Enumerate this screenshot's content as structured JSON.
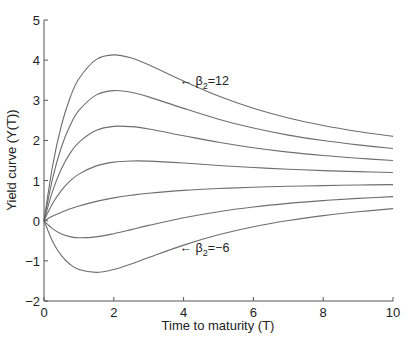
{
  "chart_data": {
    "type": "line",
    "title": "",
    "xlabel": "Time to maturity (T)",
    "ylabel": "Yield curve (Y(T))",
    "xlim": [
      0,
      10
    ],
    "ylim": [
      -2,
      5
    ],
    "xticks": [
      0,
      2,
      4,
      6,
      8,
      10
    ],
    "yticks": [
      -2,
      -1,
      0,
      1,
      2,
      3,
      4,
      5
    ],
    "grid": false,
    "legend": "none",
    "line_color": "#6e6e6e",
    "x": [
      0,
      0.25,
      0.5,
      0.75,
      1,
      1.5,
      2,
      2.5,
      3,
      4,
      5,
      6,
      7,
      8,
      9,
      10
    ],
    "series": [
      {
        "name": "beta2=12",
        "values": [
          0,
          1.387,
          2.378,
          3.07,
          3.538,
          4.02,
          4.132,
          4.054,
          3.886,
          3.48,
          3.105,
          2.799,
          2.559,
          2.371,
          2.222,
          2.1
        ]
      },
      {
        "name": "beta2=9",
        "values": [
          0,
          1.069,
          1.837,
          2.376,
          2.746,
          3.135,
          3.241,
          3.199,
          3.085,
          2.798,
          2.529,
          2.308,
          2.133,
          1.997,
          1.889,
          1.8
        ]
      },
      {
        "name": "beta2=6",
        "values": [
          0,
          0.751,
          1.296,
          1.683,
          1.953,
          2.251,
          2.35,
          2.343,
          2.285,
          2.117,
          1.953,
          1.817,
          1.708,
          1.623,
          1.556,
          1.5
        ]
      },
      {
        "name": "beta2=3",
        "values": [
          0,
          0.433,
          0.754,
          0.99,
          1.161,
          1.366,
          1.459,
          1.488,
          1.484,
          1.436,
          1.377,
          1.325,
          1.283,
          1.249,
          1.222,
          1.2
        ]
      },
      {
        "name": "beta2=0",
        "values": [
          0,
          0.115,
          0.213,
          0.297,
          0.368,
          0.482,
          0.568,
          0.633,
          0.683,
          0.755,
          0.801,
          0.834,
          0.857,
          0.875,
          0.889,
          0.9
        ]
      },
      {
        "name": "beta2=-3",
        "values": [
          0,
          -0.203,
          -0.328,
          -0.397,
          -0.425,
          -0.402,
          -0.323,
          -0.222,
          -0.117,
          0.073,
          0.225,
          0.342,
          0.432,
          0.501,
          0.556,
          0.6
        ]
      },
      {
        "name": "beta2=-6",
        "values": [
          0,
          -0.521,
          -0.869,
          -1.09,
          -1.217,
          -1.287,
          -1.214,
          -1.078,
          -0.918,
          -0.608,
          -0.351,
          -0.149,
          0.006,
          0.127,
          0.222,
          0.3
        ]
      }
    ],
    "annotations": [
      {
        "arrow": "←",
        "symbol": "β",
        "subscript": "2",
        "text": "=12",
        "x": 4.0,
        "y": 3.5
      },
      {
        "arrow": "←",
        "symbol": "β",
        "subscript": "2",
        "text": "=−6",
        "x": 4.0,
        "y": -0.65
      }
    ]
  }
}
